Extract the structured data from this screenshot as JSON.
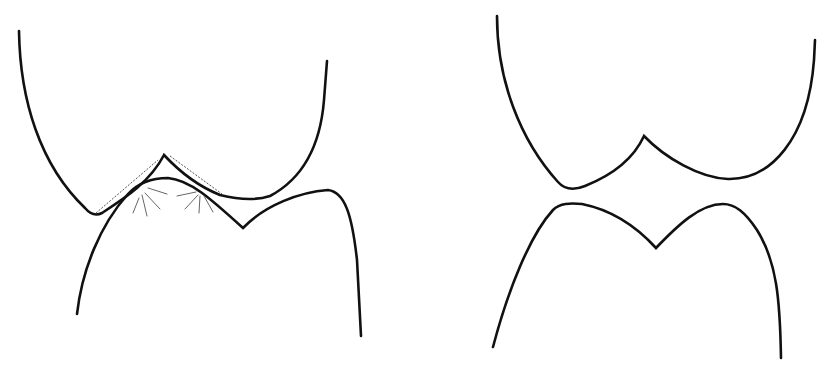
{
  "figure": {
    "stroke_color": "#111111",
    "dotted_color": "#555555",
    "hatch_color": "#666666",
    "background": "#ffffff",
    "panels": [
      {
        "id": "left",
        "state": "overlapping-contact"
      },
      {
        "id": "right",
        "state": "separated"
      }
    ]
  }
}
